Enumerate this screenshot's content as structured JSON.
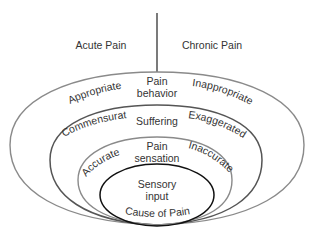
{
  "diagram": {
    "title_left": "Acute Pain",
    "title_right": "Chronic Pain",
    "layers": [
      {
        "name": "Pain behavior",
        "line1": "Pain",
        "line2": "behavior",
        "left": "Appropriate",
        "right": "Inappropriate"
      },
      {
        "name": "Suffering",
        "line1": "Suffering",
        "left": "Commensurate",
        "right": "Exaggerated"
      },
      {
        "name": "Pain sensation",
        "line1": "Pain",
        "line2": "sensation",
        "left": "Accurate",
        "right": "Inaccurate"
      },
      {
        "name": "Sensory input",
        "line1": "Sensory",
        "line2": "input",
        "bottom": "Cause of Pain"
      }
    ],
    "colors": {
      "outer_stroke": "#8a8a8a",
      "mid_stroke": "#555555",
      "inner_stroke": "#111111",
      "text": "#333333"
    }
  }
}
